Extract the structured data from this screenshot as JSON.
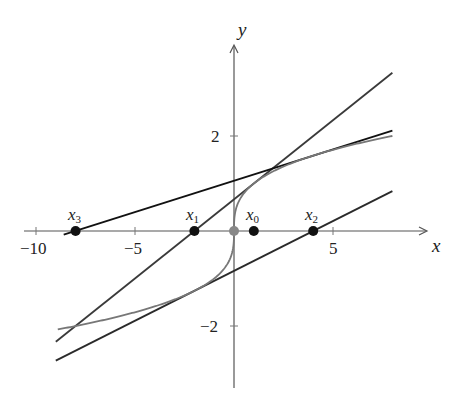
{
  "chart_data": {
    "type": "line",
    "title": "",
    "xlabel": "x",
    "ylabel": "y",
    "xlim": [
      -10.5,
      10
    ],
    "ylim": [
      -3.3,
      3.9
    ],
    "grid": false,
    "x_ticks": [
      -10,
      -5,
      5
    ],
    "x_tick_labels": [
      "−10",
      "−5",
      "5"
    ],
    "y_ticks": [
      -2,
      2
    ],
    "y_tick_labels": [
      "−2",
      "2"
    ],
    "curve": {
      "name": "f(x) = x^(1/3)",
      "x_range": [
        -8.9,
        8
      ],
      "color": "#777777"
    },
    "tangent_lines": [
      {
        "name": "tangent at x0",
        "point_x": 1,
        "slope": 0.3333,
        "x_range": [
          -9,
          8
        ],
        "color": "#3a3a3a"
      },
      {
        "name": "tangent at x1",
        "point_x": -2,
        "slope": 0.21,
        "x_range": [
          -9,
          8
        ],
        "color": "#2a2a2a"
      },
      {
        "name": "tangent at x2",
        "point_x": 4,
        "slope": 0.132,
        "x_range": [
          -8.6,
          8
        ],
        "color": "#111111"
      }
    ],
    "points": [
      {
        "label": "x0",
        "x": 1,
        "y": 0
      },
      {
        "label": "x1",
        "x": -2,
        "y": 0
      },
      {
        "label": "x2",
        "x": 4,
        "y": 0
      },
      {
        "label": "x3",
        "x": -8,
        "y": 0
      },
      {
        "label": "",
        "x": 0,
        "y": 0,
        "color": "#888888"
      }
    ]
  },
  "labels": {
    "x_axis": "x",
    "y_axis": "y",
    "tick_m10": "−10",
    "tick_m5": "−5",
    "tick_5": "5",
    "tick_2": "2",
    "tick_m2": "−2",
    "pt_x0": "x",
    "pt_x0_sub": "0",
    "pt_x1": "x",
    "pt_x1_sub": "1",
    "pt_x2": "x",
    "pt_x2_sub": "2",
    "pt_x3": "x",
    "pt_x3_sub": "3"
  }
}
